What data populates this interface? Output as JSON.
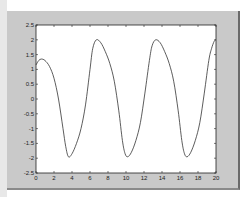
{
  "chart_data": {
    "type": "line",
    "title": "",
    "xlabel": "",
    "ylabel": "",
    "xlim": [
      0,
      20
    ],
    "ylim": [
      -2.5,
      2.5
    ],
    "grid": false,
    "legend": null,
    "x_ticks": [
      0,
      2,
      4,
      6,
      8,
      10,
      12,
      14,
      16,
      18,
      20
    ],
    "x_tick_labels": [
      "0",
      "2",
      "4",
      "6",
      "8",
      "10",
      "12",
      "14",
      "16",
      "18",
      "20"
    ],
    "y_ticks": [
      2.5,
      2,
      1.5,
      1,
      0.5,
      0,
      -0.5,
      -1,
      -1.5,
      -2,
      -2.5
    ],
    "y_tick_labels": [
      "2.5",
      "2",
      "1.5",
      "1",
      "0.5",
      "0",
      "-0.5",
      "-1",
      "-1.5",
      "-2",
      "-2.5"
    ],
    "series": [
      {
        "name": "y",
        "color": "#333333",
        "x": [
          0,
          0.3,
          0.6,
          1.0,
          1.5,
          2.0,
          2.5,
          3.0,
          3.3,
          3.6,
          4.0,
          4.5,
          5.0,
          5.5,
          6.0,
          6.3,
          6.7,
          7.2,
          7.7,
          8.2,
          8.7,
          9.2,
          9.6,
          9.9,
          10.2,
          10.6,
          11.1,
          11.6,
          12.1,
          12.6,
          12.9,
          13.3,
          13.8,
          14.3,
          14.8,
          15.3,
          15.8,
          16.2,
          16.5,
          16.8,
          17.2,
          17.7,
          18.2,
          18.7,
          19.2,
          19.5,
          19.8,
          20.0
        ],
        "y": [
          1.15,
          1.3,
          1.35,
          1.3,
          1.1,
          0.7,
          0.0,
          -1.0,
          -1.6,
          -1.95,
          -1.85,
          -1.5,
          -1.0,
          -0.2,
          1.0,
          1.7,
          2.0,
          1.9,
          1.6,
          1.2,
          0.6,
          -0.4,
          -1.4,
          -1.85,
          -1.95,
          -1.8,
          -1.4,
          -0.8,
          0.2,
          1.3,
          1.8,
          2.0,
          1.9,
          1.6,
          1.2,
          0.6,
          -0.4,
          -1.4,
          -1.85,
          -1.95,
          -1.8,
          -1.4,
          -0.8,
          0.2,
          1.3,
          1.7,
          1.95,
          2.0
        ]
      }
    ]
  },
  "colors": {
    "figure_background": "#c9c9c9",
    "axes_background": "#ffffff",
    "line": "#333333",
    "axis": "#222222"
  }
}
